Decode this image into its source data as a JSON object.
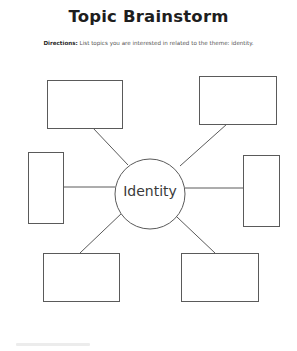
{
  "worksheet": {
    "title": "Topic Brainstorm",
    "directions_label": "Directions:",
    "directions_text": " List topics you are interested in related to the theme: identity.",
    "center_topic": "Identity",
    "branch_boxes": [
      {
        "position": "top-left",
        "content": ""
      },
      {
        "position": "top-right",
        "content": ""
      },
      {
        "position": "left",
        "content": ""
      },
      {
        "position": "right",
        "content": ""
      },
      {
        "position": "bottom-left",
        "content": ""
      },
      {
        "position": "bottom-right",
        "content": ""
      }
    ],
    "colors": {
      "ink": "#555555",
      "title": "#1e1e1e"
    }
  }
}
